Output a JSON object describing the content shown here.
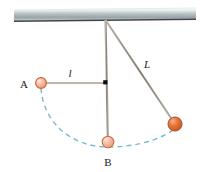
{
  "figure": {
    "background_color": "#ffffff",
    "width": 202,
    "height": 172
  },
  "ceiling": {
    "name": "ceiling-support",
    "fill_top_color": "#f2f4f5",
    "fill_mid_color": "#a9b2b6",
    "edge_line_color": "#3d4548",
    "left_x": 14,
    "right_x": 196,
    "top_y": 9,
    "bottom_y": 22
  },
  "pivot": {
    "label": "",
    "x": 105,
    "y": 21,
    "color": "#8a8279"
  },
  "rods": {
    "vertical": {
      "name": "vertical-rod",
      "color": "#8a8075",
      "width": 1.6,
      "from_x": 105,
      "from_y": 21,
      "to_x": 108,
      "to_y": 140
    },
    "diagonal": {
      "name": "diagonal-rod",
      "color": "#6f6a63",
      "width": 1.6,
      "from_x": 105,
      "from_y": 21,
      "to_x": 175,
      "to_y": 123
    },
    "horizontal": {
      "name": "horizontal-segment",
      "color": "#b09a90",
      "width": 1.4,
      "from_x": 41,
      "from_y": 83,
      "to_x": 105,
      "to_y": 83
    }
  },
  "balls": [
    {
      "name": "ball-a",
      "label": "A",
      "cx": 41,
      "cy": 83,
      "r": 5.4,
      "fill": "#f4b79c",
      "stroke": "#c9603a",
      "highlight": "#fde3d6"
    },
    {
      "name": "ball-b",
      "label": "B",
      "cx": 108,
      "cy": 142,
      "r": 5.6,
      "fill": "#f6bfa6",
      "stroke": "#cf6b44",
      "highlight": "#fde7da"
    },
    {
      "name": "ball-right",
      "label": "",
      "cx": 175,
      "cy": 124,
      "r": 7.0,
      "fill": "#e06a35",
      "stroke": "#b04a20",
      "highlight": "#f6b18a"
    }
  ],
  "center_dot": {
    "name": "center-pivot-dot",
    "cx": 105,
    "cy": 82,
    "r": 2.2,
    "color": "#111111"
  },
  "arc": {
    "name": "swing-path-arc",
    "color": "#7fb8cc",
    "dash": "5 4",
    "width": 1.3,
    "path": "M 41 88 C 44 124, 72 147, 108 147 C 140 147, 166 136, 178 124"
  },
  "labels": {
    "point_a": "A",
    "point_b": "B",
    "length_l_lower": "l",
    "length_l_upper": "L"
  },
  "label_positions": {
    "point_a": {
      "x": 24,
      "y": 88
    },
    "point_b": {
      "x": 104,
      "y": 165
    },
    "length_l_lower": {
      "x": 70,
      "y": 77
    },
    "length_l_upper": {
      "x": 147,
      "y": 68
    }
  },
  "colors": {
    "ball_light": "#f4b79c",
    "ball_dark": "#e06a35",
    "arc_blue": "#7fb8cc",
    "rod_gray": "#8a8075",
    "ceiling_gray": "#a9b2b6",
    "text_black": "#1a1a1a"
  }
}
